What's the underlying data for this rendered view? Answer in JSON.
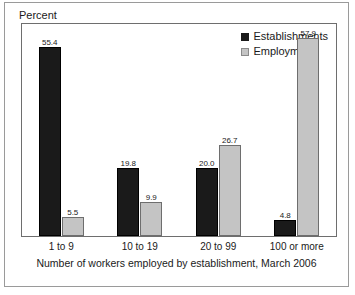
{
  "chart_data": {
    "type": "bar",
    "title": "",
    "subtitle": "",
    "ylabel": "Percent",
    "xlabel": "Number of workers employed by establishment, March 2006",
    "categories": [
      "1 to 9",
      "10 to 19",
      "20 to 99",
      "100 or more"
    ],
    "series": [
      {
        "name": "Establishments",
        "color": "#1a1a1a",
        "values": [
          55.4,
          19.8,
          20.0,
          4.8
        ],
        "labels": [
          "55.4",
          "19.8",
          "20.0",
          "4.8"
        ]
      },
      {
        "name": "Employment",
        "color": "#c4c4c4",
        "values": [
          5.5,
          9.9,
          26.7,
          57.9
        ],
        "labels": [
          "5.5",
          "9.9",
          "26.7",
          "57.9"
        ]
      }
    ],
    "ylim": [
      0,
      62
    ],
    "grid": false,
    "yticks_visible": false,
    "legend_position": "top-right",
    "legend_entries": [
      "Establishments",
      "Employment"
    ]
  },
  "legend": {
    "items": [
      {
        "label": "Establishments",
        "swatch": "series-dark"
      },
      {
        "label": "Employment",
        "swatch": "series-light"
      }
    ]
  }
}
